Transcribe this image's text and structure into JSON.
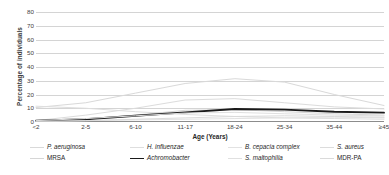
{
  "chart_data": {
    "type": "line",
    "title": "",
    "xlabel": "Age (Years)",
    "ylabel": "Percentage of individuals",
    "categories": [
      "<2",
      "2-5",
      "6-10",
      "11-17",
      "18-24",
      "25-34",
      "35-44",
      "≥45"
    ],
    "ylim": [
      0,
      80
    ],
    "yticks": [
      0,
      10,
      20,
      30,
      40,
      50,
      60,
      70,
      80
    ],
    "grid": true,
    "legend_position": "bottom",
    "series": [
      {
        "name": "P. aeruginosa",
        "italic": true,
        "color": "#d9d9d9",
        "width": 1.0,
        "values": [
          10.5,
          14.0,
          21.0,
          28.0,
          31.5,
          29.0,
          20.0,
          12.0
        ]
      },
      {
        "name": "H. influenzae",
        "italic": true,
        "color": "#dedede",
        "width": 1.0,
        "values": [
          11.5,
          10.0,
          7.5,
          5.5,
          4.0,
          3.0,
          2.5,
          2.0
        ]
      },
      {
        "name": "B. cepacia complex",
        "italic": true,
        "color": "#e2e2e2",
        "width": 1.0,
        "values": [
          0.5,
          1.0,
          1.5,
          2.0,
          2.5,
          3.0,
          3.5,
          3.0
        ]
      },
      {
        "name": "S. aureus",
        "italic": true,
        "color": "#dcdcdc",
        "width": 1.0,
        "values": [
          1.0,
          5.0,
          10.0,
          16.0,
          17.0,
          14.0,
          11.0,
          9.5
        ]
      },
      {
        "name": "MRSA",
        "italic": false,
        "color": "#d6d6d6",
        "width": 1.0,
        "values": [
          0.5,
          2.0,
          5.0,
          8.5,
          9.0,
          7.5,
          6.0,
          5.0
        ]
      },
      {
        "name": "Achromobacter",
        "italic": true,
        "color": "#1a1a1a",
        "width": 1.9,
        "values": [
          1.0,
          2.0,
          4.5,
          7.0,
          9.5,
          9.0,
          7.5,
          6.8
        ]
      },
      {
        "name": "S. maltophilia",
        "italic": true,
        "color": "#e0e0e0",
        "width": 1.0,
        "values": [
          1.0,
          2.5,
          4.5,
          6.5,
          7.0,
          6.0,
          5.0,
          4.5
        ]
      },
      {
        "name": "MDR-PA",
        "italic": false,
        "color": "#dadada",
        "width": 1.0,
        "values": [
          0.5,
          1.0,
          2.0,
          3.0,
          4.0,
          4.5,
          4.0,
          3.5
        ]
      }
    ]
  },
  "legend": {
    "items": [
      {
        "label": "P. aeruginosa",
        "italic": true,
        "color": "#d9d9d9",
        "width": 1.0,
        "row": 0,
        "col": 0
      },
      {
        "label": "H. influenzae",
        "italic": true,
        "color": "#dedede",
        "width": 1.0,
        "row": 0,
        "col": 1
      },
      {
        "label": "B. cepacia complex",
        "italic": true,
        "color": "#e2e2e2",
        "width": 1.0,
        "row": 0,
        "col": 2
      },
      {
        "label": "S. aureus",
        "italic": true,
        "color": "#dcdcdc",
        "width": 1.0,
        "row": 0,
        "col": 3
      },
      {
        "label": "MRSA",
        "italic": false,
        "color": "#d6d6d6",
        "width": 1.0,
        "row": 1,
        "col": 0
      },
      {
        "label": "Achromobacter",
        "italic": true,
        "color": "#1a1a1a",
        "width": 1.9,
        "row": 1,
        "col": 1
      },
      {
        "label": "S. maltophilia",
        "italic": true,
        "color": "#e0e0e0",
        "width": 1.0,
        "row": 1,
        "col": 2
      },
      {
        "label": "MDR-PA",
        "italic": false,
        "color": "#dadada",
        "width": 1.0,
        "row": 1,
        "col": 3
      }
    ]
  }
}
